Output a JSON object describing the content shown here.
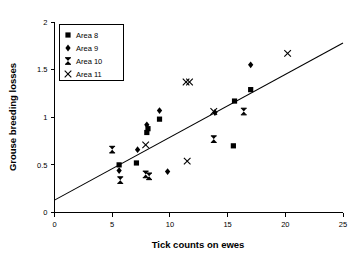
{
  "chart_data": {
    "type": "scatter",
    "title": "",
    "xlabel": "Tick counts on ewes",
    "ylabel": "Grouse breeding losses",
    "xlim": [
      0,
      25
    ],
    "ylim": [
      0,
      2
    ],
    "xticks": [
      "0",
      "5",
      "10",
      "15",
      "20",
      "25"
    ],
    "yticks": [
      "0",
      "0.5",
      "1",
      "1.5",
      "2"
    ],
    "xtick_values": [
      0,
      5,
      10,
      15,
      20,
      25
    ],
    "ytick_values": [
      0,
      0.5,
      1,
      1.5,
      2
    ],
    "grid": false,
    "legend_position": "top-left",
    "series": [
      {
        "name": "Area 8",
        "marker": "filled-square",
        "points": [
          {
            "x": 5.6,
            "y": 0.5
          },
          {
            "x": 7.1,
            "y": 0.52
          },
          {
            "x": 8.0,
            "y": 0.84
          },
          {
            "x": 8.1,
            "y": 0.88
          },
          {
            "x": 9.1,
            "y": 0.98
          },
          {
            "x": 15.5,
            "y": 0.7
          },
          {
            "x": 15.6,
            "y": 1.17
          },
          {
            "x": 17.0,
            "y": 1.29
          }
        ]
      },
      {
        "name": "Area 9",
        "marker": "filled-diamond",
        "points": [
          {
            "x": 5.6,
            "y": 0.44
          },
          {
            "x": 7.2,
            "y": 0.66
          },
          {
            "x": 8.0,
            "y": 0.92
          },
          {
            "x": 9.1,
            "y": 1.07
          },
          {
            "x": 9.8,
            "y": 0.43
          },
          {
            "x": 13.9,
            "y": 1.05
          },
          {
            "x": 17.0,
            "y": 1.55
          }
        ]
      },
      {
        "name": "Area 10",
        "marker": "bowtie",
        "points": [
          {
            "x": 5.0,
            "y": 0.66
          },
          {
            "x": 5.7,
            "y": 0.34
          },
          {
            "x": 7.9,
            "y": 0.4
          },
          {
            "x": 8.2,
            "y": 0.38
          },
          {
            "x": 13.8,
            "y": 0.77
          },
          {
            "x": 16.4,
            "y": 1.06
          }
        ]
      },
      {
        "name": "Area 11",
        "marker": "cross-x",
        "points": [
          {
            "x": 7.9,
            "y": 0.71
          },
          {
            "x": 11.4,
            "y": 1.37
          },
          {
            "x": 11.7,
            "y": 1.37
          },
          {
            "x": 11.5,
            "y": 0.54
          },
          {
            "x": 13.8,
            "y": 1.06
          },
          {
            "x": 20.2,
            "y": 1.67
          }
        ]
      }
    ],
    "fit_line": {
      "name": "regression-line",
      "x_start": 0,
      "y_start": 0.13,
      "x_end": 25,
      "y_end": 1.78
    }
  },
  "legend": {
    "items": [
      {
        "label": "Area 8",
        "marker": "filled-square"
      },
      {
        "label": "Area 9",
        "marker": "filled-diamond"
      },
      {
        "label": "Area 10",
        "marker": "bowtie"
      },
      {
        "label": "Area 11",
        "marker": "cross-x"
      }
    ]
  }
}
